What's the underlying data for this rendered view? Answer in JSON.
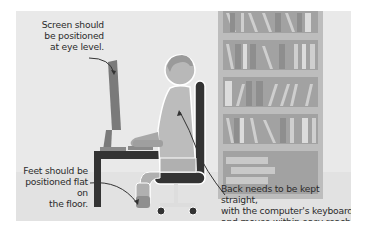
{
  "illustration": {
    "title": "Ergonomic workstation setup",
    "colors": {
      "panel_background": "#e9e9e9",
      "floor": "#e2e2e2",
      "bookshelf_frame": "#b9b9b9",
      "bookshelf_back": "#9a9a9a",
      "desk_and_chair": "#3a3a3a",
      "person": "#a9a9a9",
      "text": "#2b2b2b"
    },
    "annotations": {
      "screen": {
        "lines": [
          "Screen should",
          "be positioned",
          "at eye level."
        ]
      },
      "feet": {
        "lines": [
          "Feet should be",
          "positioned flat on",
          "the floor."
        ]
      },
      "back": {
        "lines": [
          "Back needs to be kept straight,",
          "with the computer's keyboard",
          "and mouse within easy reach."
        ]
      }
    }
  }
}
